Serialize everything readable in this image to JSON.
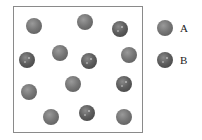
{
  "diagram": {
    "box": {
      "left": 13,
      "top": 6,
      "width": 130,
      "height": 127
    },
    "particles": [
      {
        "type": "A",
        "x": 34,
        "y": 26
      },
      {
        "type": "A",
        "x": 85,
        "y": 22
      },
      {
        "type": "B",
        "x": 120,
        "y": 29
      },
      {
        "type": "B",
        "x": 27,
        "y": 60
      },
      {
        "type": "A",
        "x": 60,
        "y": 53
      },
      {
        "type": "B",
        "x": 89,
        "y": 61
      },
      {
        "type": "A",
        "x": 129,
        "y": 55
      },
      {
        "type": "A",
        "x": 29,
        "y": 92
      },
      {
        "type": "A",
        "x": 73,
        "y": 84
      },
      {
        "type": "B",
        "x": 124,
        "y": 84
      },
      {
        "type": "A",
        "x": 51,
        "y": 117
      },
      {
        "type": "B",
        "x": 87,
        "y": 113
      },
      {
        "type": "A",
        "x": 124,
        "y": 117
      }
    ],
    "counts": {
      "A": 8,
      "B": 5
    }
  },
  "legend": {
    "items": [
      {
        "type": "A",
        "label": "A",
        "x": 165,
        "y": 28,
        "label_x": 180
      },
      {
        "type": "B",
        "label": "B",
        "x": 165,
        "y": 60,
        "label_x": 180
      }
    ]
  },
  "colors": {
    "A": "#777777",
    "B": "#5e5e5e",
    "border": "#8a8a8a"
  }
}
